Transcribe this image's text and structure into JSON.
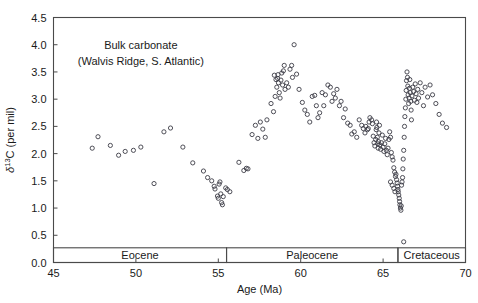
{
  "chart_data": {
    "type": "scatter",
    "title": "",
    "annotations": [
      {
        "text": "Bulk carbonate",
        "x": 50.3,
        "y": 3.93
      },
      {
        "text": "(Walvis Ridge, S. Atlantic)",
        "x": 50.3,
        "y": 3.62
      }
    ],
    "xlabel": "Age (Ma)",
    "ylabel": "δ¹³C (per mil)",
    "ylabel_parts": {
      "delta": "δ",
      "superscript": "13",
      "rest": "C (per mil)"
    },
    "xlim": [
      45,
      70
    ],
    "ylim": [
      0.0,
      4.5
    ],
    "xticks": [
      45,
      50,
      55,
      60,
      65,
      70
    ],
    "xtick_labels": [
      "45",
      "50",
      "55",
      "60",
      "65",
      "70"
    ],
    "yticks": [
      0.0,
      0.5,
      1.0,
      1.5,
      2.0,
      2.5,
      3.0,
      3.5,
      4.0,
      4.5
    ],
    "ytick_labels": [
      "0.0",
      "0.5",
      "1.0",
      "1.5",
      "2.0",
      "2.5",
      "3.0",
      "3.5",
      "4.0",
      "4.5"
    ],
    "grid": false,
    "legend": "none",
    "marker": "open-circle",
    "marker_color": "#3c3c46",
    "epoch_bands": [
      {
        "label": "Eocene",
        "x_start": 45.0,
        "x_end": 55.5
      },
      {
        "label": "Paleocene",
        "x_start": 55.5,
        "x_end": 65.9
      },
      {
        "label": "Cretaceous",
        "x_start": 65.9,
        "x_end": 70.0
      }
    ],
    "epoch_band_y_top": 0.27,
    "epoch_band_y_bottom": 0.0,
    "series": [
      {
        "name": "Bulk carbonate δ13C",
        "points": [
          [
            47.35,
            2.1
          ],
          [
            47.7,
            2.31
          ],
          [
            48.45,
            2.15
          ],
          [
            48.95,
            1.97
          ],
          [
            49.35,
            2.04
          ],
          [
            49.85,
            2.06
          ],
          [
            50.3,
            2.12
          ],
          [
            51.1,
            1.45
          ],
          [
            51.7,
            2.4
          ],
          [
            52.1,
            2.47
          ],
          [
            52.85,
            2.12
          ],
          [
            53.45,
            1.83
          ],
          [
            54.1,
            1.68
          ],
          [
            54.35,
            1.56
          ],
          [
            54.6,
            1.5
          ],
          [
            54.75,
            1.4
          ],
          [
            54.8,
            1.35
          ],
          [
            54.95,
            1.22
          ],
          [
            55.0,
            1.18
          ],
          [
            55.05,
            1.44
          ],
          [
            55.1,
            1.48
          ],
          [
            55.15,
            1.26
          ],
          [
            55.2,
            1.1
          ],
          [
            55.25,
            1.06
          ],
          [
            55.3,
            1.21
          ],
          [
            55.45,
            1.37
          ],
          [
            55.55,
            1.34
          ],
          [
            55.7,
            1.3
          ],
          [
            56.25,
            1.84
          ],
          [
            56.55,
            1.69
          ],
          [
            56.7,
            1.73
          ],
          [
            56.8,
            1.72
          ],
          [
            57.05,
            2.35
          ],
          [
            57.4,
            2.28
          ],
          [
            57.55,
            2.58
          ],
          [
            57.7,
            2.45
          ],
          [
            57.95,
            2.62
          ],
          [
            58.2,
            2.92
          ],
          [
            58.35,
            2.77
          ],
          [
            58.45,
            3.05
          ],
          [
            58.55,
            3.22
          ],
          [
            58.6,
            3.38
          ],
          [
            58.62,
            3.45
          ],
          [
            58.65,
            3.3
          ],
          [
            58.7,
            3.12
          ],
          [
            58.75,
            3.02
          ],
          [
            58.85,
            3.48
          ],
          [
            58.95,
            3.52
          ],
          [
            59.0,
            3.62
          ],
          [
            59.15,
            3.3
          ],
          [
            59.25,
            3.22
          ],
          [
            59.35,
            3.55
          ],
          [
            59.45,
            3.62
          ],
          [
            59.5,
            3.4
          ],
          [
            59.6,
            4.0
          ],
          [
            59.75,
            3.46
          ],
          [
            59.9,
            3.18
          ],
          [
            60.1,
            2.94
          ],
          [
            60.4,
            2.72
          ],
          [
            60.7,
            3.05
          ],
          [
            60.85,
            3.07
          ],
          [
            60.95,
            2.88
          ],
          [
            61.15,
            2.75
          ],
          [
            61.3,
            3.12
          ],
          [
            61.5,
            3.08
          ],
          [
            61.65,
            3.26
          ],
          [
            61.8,
            3.22
          ],
          [
            62.0,
            3.1
          ],
          [
            62.2,
            3.18
          ],
          [
            62.45,
            2.96
          ],
          [
            62.7,
            2.82
          ],
          [
            63.0,
            2.52
          ],
          [
            63.25,
            2.4
          ],
          [
            63.55,
            2.62
          ],
          [
            63.8,
            2.46
          ],
          [
            63.95,
            2.5
          ],
          [
            64.1,
            2.46
          ],
          [
            64.2,
            2.66
          ],
          [
            64.3,
            2.62
          ],
          [
            64.35,
            2.55
          ],
          [
            64.4,
            2.32
          ],
          [
            64.45,
            2.2
          ],
          [
            64.5,
            2.14
          ],
          [
            64.55,
            2.26
          ],
          [
            64.58,
            2.44
          ],
          [
            64.6,
            2.58
          ],
          [
            64.62,
            2.48
          ],
          [
            64.65,
            2.3
          ],
          [
            64.68,
            2.18
          ],
          [
            64.7,
            2.1
          ],
          [
            64.72,
            2.22
          ],
          [
            64.75,
            2.38
          ],
          [
            64.78,
            2.52
          ],
          [
            64.8,
            2.16
          ],
          [
            64.85,
            2.08
          ],
          [
            64.9,
            2.2
          ],
          [
            64.95,
            2.34
          ],
          [
            65.0,
            2.12
          ],
          [
            65.05,
            2.04
          ],
          [
            65.1,
            2.18
          ],
          [
            65.15,
            2.28
          ],
          [
            65.2,
            2.06
          ],
          [
            65.25,
            1.98
          ],
          [
            65.3,
            2.1
          ],
          [
            65.35,
            2.26
          ],
          [
            65.4,
            2.4
          ],
          [
            65.45,
            2.3
          ],
          [
            65.5,
            2.02
          ],
          [
            65.55,
            1.94
          ],
          [
            65.6,
            1.88
          ],
          [
            65.65,
            1.74
          ],
          [
            65.7,
            1.66
          ],
          [
            65.75,
            1.58
          ],
          [
            65.78,
            1.62
          ],
          [
            65.82,
            1.52
          ],
          [
            65.85,
            1.46
          ],
          [
            65.88,
            1.4
          ],
          [
            65.9,
            1.34
          ],
          [
            65.92,
            1.3
          ],
          [
            65.95,
            1.24
          ],
          [
            65.98,
            1.18
          ],
          [
            66.0,
            1.12
          ],
          [
            66.02,
            1.06
          ],
          [
            66.05,
            1.0
          ],
          [
            66.08,
            0.96
          ],
          [
            66.1,
            1.04
          ],
          [
            66.12,
            1.42
          ],
          [
            66.15,
            1.48
          ],
          [
            66.18,
            1.56
          ],
          [
            66.2,
            1.72
          ],
          [
            66.22,
            1.9
          ],
          [
            66.25,
            2.06
          ],
          [
            66.28,
            2.3
          ],
          [
            66.3,
            2.5
          ],
          [
            66.32,
            2.68
          ],
          [
            66.35,
            2.84
          ],
          [
            66.38,
            3.0
          ],
          [
            66.4,
            3.16
          ],
          [
            66.42,
            3.34
          ],
          [
            66.45,
            3.5
          ],
          [
            66.48,
            3.4
          ],
          [
            66.5,
            3.24
          ],
          [
            66.52,
            3.08
          ],
          [
            66.55,
            2.92
          ],
          [
            66.58,
            3.02
          ],
          [
            66.6,
            3.2
          ],
          [
            66.62,
            3.36
          ],
          [
            66.65,
            3.12
          ],
          [
            66.68,
            2.96
          ],
          [
            66.7,
            2.8
          ],
          [
            66.72,
            2.62
          ],
          [
            66.75,
            3.06
          ],
          [
            66.8,
            3.22
          ],
          [
            66.85,
            3.14
          ],
          [
            66.9,
            2.98
          ],
          [
            66.95,
            3.28
          ],
          [
            67.0,
            3.1
          ],
          [
            67.05,
            2.94
          ],
          [
            67.1,
            3.18
          ],
          [
            67.15,
            3.02
          ],
          [
            67.25,
            3.3
          ],
          [
            67.35,
            3.12
          ],
          [
            67.45,
            2.88
          ],
          [
            67.55,
            3.22
          ],
          [
            67.7,
            3.04
          ],
          [
            67.85,
            3.26
          ],
          [
            68.0,
            3.08
          ],
          [
            68.2,
            2.92
          ],
          [
            68.4,
            2.72
          ],
          [
            68.6,
            2.56
          ],
          [
            68.85,
            2.48
          ],
          [
            66.25,
            0.38
          ],
          [
            65.45,
            1.48
          ],
          [
            65.55,
            1.42
          ],
          [
            65.65,
            1.36
          ],
          [
            65.72,
            1.3
          ],
          [
            64.15,
            2.58
          ],
          [
            64.05,
            2.44
          ],
          [
            63.9,
            2.38
          ],
          [
            63.7,
            2.52
          ],
          [
            63.4,
            2.3
          ],
          [
            63.1,
            2.36
          ],
          [
            62.85,
            2.56
          ],
          [
            62.6,
            2.66
          ],
          [
            62.35,
            2.88
          ],
          [
            62.1,
            3.02
          ],
          [
            61.9,
            2.96
          ],
          [
            61.4,
            2.88
          ],
          [
            61.05,
            2.66
          ],
          [
            60.55,
            2.58
          ],
          [
            60.25,
            2.8
          ],
          [
            59.05,
            3.18
          ],
          [
            58.9,
            3.26
          ],
          [
            58.8,
            3.35
          ],
          [
            58.5,
            3.36
          ],
          [
            58.4,
            3.44
          ],
          [
            57.85,
            2.3
          ],
          [
            57.25,
            2.52
          ]
        ]
      }
    ]
  }
}
